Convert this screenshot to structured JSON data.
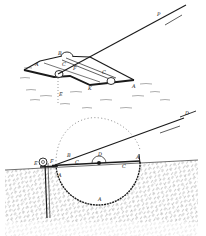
{
  "figure": {
    "background": "#ffffff",
    "ink": "#1a1a1a",
    "top_view": {
      "labels": {
        "A_left": "A",
        "B": "B",
        "C_left": "C",
        "C_right": "C",
        "F": "F",
        "E": "E",
        "K": "K",
        "A_right": "A",
        "P": "P",
        "D": "D"
      }
    },
    "section_view": {
      "labels": {
        "E": "E",
        "F": "F",
        "B": "B",
        "C_left": "C",
        "D": "D",
        "C_right": "C",
        "A_top_right": "A",
        "A_left": "A",
        "A_bottom": "A"
      }
    }
  }
}
